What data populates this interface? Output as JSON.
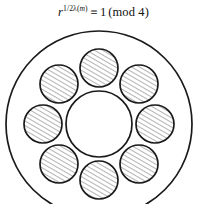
{
  "page": {
    "background_color": "#ffffff",
    "width": 207,
    "height": 204
  },
  "formula": {
    "base": "r",
    "exponent_fraction": "1/2",
    "exponent_function": "λ(m)",
    "exponent_plain": "½λ(m)",
    "relation_symbol": "≡",
    "right_side": "1",
    "modulus_text": "(mod 4)",
    "full_text": "r^(½λ(m)) ≡ 1 (mod 4)",
    "half_numerator": "1",
    "half_denominator": "2",
    "lambda_symbol": "λ",
    "arg_open": "(",
    "arg_var": "m",
    "arg_close": ")",
    "mod_open": "(",
    "mod_word": "mod",
    "mod_value": "4",
    "mod_close": ")"
  },
  "diagram": {
    "type": "annulus-with-satellite-disks",
    "stroke_color": "#1a1a1a",
    "hatch_color": "#4a4a4a",
    "fill_color": "#ffffff",
    "outer_circle": {
      "cx": 99,
      "cy": 100,
      "r": 93,
      "stroke_width": 1.7
    },
    "inner_circle": {
      "cx": 99,
      "cy": 100,
      "r": 33,
      "stroke_width": 1.7
    },
    "satellite_ring_radius": 56,
    "satellite_radius": 19,
    "satellite_stroke_width": 1.7,
    "satellite_count": 8,
    "hatch_angle_deg": 60,
    "hatch_spacing": 4,
    "satellites": [
      {
        "label": "satellite-top",
        "cx": 99,
        "cy": 44,
        "angle_deg": 270
      },
      {
        "label": "satellite-top-right",
        "cx": 139,
        "cy": 60,
        "angle_deg": 315
      },
      {
        "label": "satellite-right",
        "cx": 155,
        "cy": 100,
        "angle_deg": 0
      },
      {
        "label": "satellite-bottom-right",
        "cx": 139,
        "cy": 140,
        "angle_deg": 45
      },
      {
        "label": "satellite-bottom",
        "cx": 99,
        "cy": 156,
        "angle_deg": 90
      },
      {
        "label": "satellite-bottom-left",
        "cx": 59,
        "cy": 140,
        "angle_deg": 135
      },
      {
        "label": "satellite-left",
        "cx": 43,
        "cy": 100,
        "angle_deg": 180
      },
      {
        "label": "satellite-top-left",
        "cx": 59,
        "cy": 60,
        "angle_deg": 225
      }
    ]
  }
}
